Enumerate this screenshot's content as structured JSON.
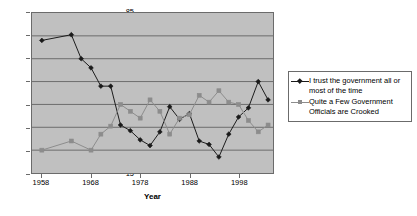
{
  "chart_data": {
    "type": "line",
    "title": "",
    "xlabel": "Year",
    "ylabel": "",
    "xlim": [
      1956,
      2005
    ],
    "ylim": [
      15,
      85
    ],
    "grid": true,
    "grid_axis": "y",
    "legend_position": "right",
    "y_ticks": [
      85,
      75,
      65,
      55,
      45,
      35,
      25,
      15
    ],
    "x_ticks": [
      1958,
      1968,
      1978,
      1988,
      1998
    ],
    "series": [
      {
        "name": "I trust the government all or most of the time",
        "color": "#1a1a1a",
        "marker": "diamond",
        "x": [
          1958,
          1964,
          1966,
          1968,
          1970,
          1972,
          1974,
          1976,
          1978,
          1980,
          1982,
          1984,
          1986,
          1988,
          1990,
          1992,
          1994,
          1996,
          1998,
          2000,
          2002,
          2004
        ],
        "values": [
          73,
          75.5,
          65,
          61,
          53,
          53,
          36,
          33.5,
          29.5,
          27,
          33,
          44,
          38.5,
          41,
          29,
          27.5,
          22,
          32,
          39.5,
          43.5,
          55,
          47
        ]
      },
      {
        "name": "Quite a Few Government Officials are Crooked",
        "color": "#8c8c8c",
        "marker": "square",
        "x": [
          1958,
          1964,
          1968,
          1970,
          1972,
          1974,
          1976,
          1978,
          1980,
          1982,
          1984,
          1986,
          1988,
          1990,
          1992,
          1994,
          1996,
          1998,
          2000,
          2002,
          2004
        ],
        "values": [
          25,
          29,
          25,
          32,
          35.5,
          45,
          42,
          39,
          47,
          42,
          32,
          39,
          40.5,
          49,
          46,
          51,
          46,
          45,
          38,
          33,
          36
        ]
      }
    ]
  },
  "legend": {
    "entries": [
      {
        "label": "I trust the government all or\nmost of the time",
        "color": "#1a1a1a",
        "marker": "diamond"
      },
      {
        "label": "Quite a Few Government\nOfficials are Crooked",
        "color": "#8c8c8c",
        "marker": "square"
      }
    ]
  },
  "axes": {
    "y_labels": [
      "85",
      "75",
      "65",
      "55",
      "45",
      "35",
      "25",
      "15"
    ],
    "x_labels": [
      "1958",
      "1968",
      "1978",
      "1988",
      "1998"
    ],
    "x_title": "Year"
  },
  "colors": {
    "plot_background": "#c0c0c0",
    "page_background": "#ffffff",
    "grid": "#6b6b6b",
    "axis": "#6b6b6b",
    "series_trust": "#1a1a1a",
    "series_crooked": "#8c8c8c"
  }
}
